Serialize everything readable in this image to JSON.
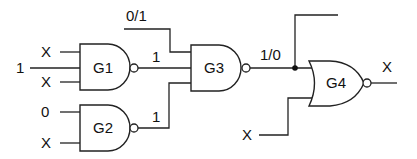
{
  "diagram": {
    "type": "logic-circuit",
    "gates": [
      {
        "id": "G1",
        "label": "G1",
        "kind": "NAND",
        "inputs": [
          "X",
          "1",
          "X"
        ],
        "output": "1"
      },
      {
        "id": "G2",
        "label": "G2",
        "kind": "NAND",
        "inputs": [
          "0",
          "X"
        ],
        "output": "1"
      },
      {
        "id": "G3",
        "label": "G3",
        "kind": "NAND",
        "inputs": [
          "0/1",
          "1",
          "1"
        ],
        "output": "1/0"
      },
      {
        "id": "G4",
        "label": "G4",
        "kind": "NOR",
        "inputs": [
          "1/0",
          "X"
        ],
        "output": "X"
      }
    ],
    "labels": {
      "g1_in_top": "X",
      "g1_in_mid": "1",
      "g1_in_bot": "X",
      "g2_in_top": "0",
      "g2_in_bot": "X",
      "g1_out": "1",
      "g2_out": "1",
      "g3_in_top": "0/1",
      "g3_out": "1/0",
      "g4_in_bot": "X",
      "g4_out": "X"
    },
    "colors": {
      "line": "#222222",
      "background": "#ffffff"
    }
  }
}
